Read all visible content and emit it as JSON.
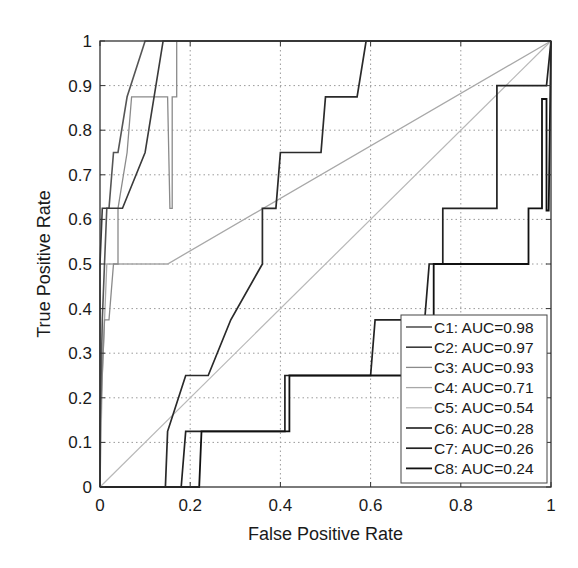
{
  "chart_data": {
    "type": "line",
    "title": "",
    "xlabel": "False Positive Rate",
    "ylabel": "True Positive Rate",
    "xlim": [
      0,
      1
    ],
    "ylim": [
      0,
      1
    ],
    "grid": true,
    "legend_position": "lower right",
    "x_ticks": [
      "0",
      "0.2",
      "0.4",
      "0.6",
      "0.8",
      "1"
    ],
    "y_ticks": [
      "0",
      "0.1",
      "0.2",
      "0.3",
      "0.4",
      "0.5",
      "0.6",
      "0.7",
      "0.8",
      "0.9",
      "1"
    ],
    "series": [
      {
        "name": "C1: AUC=0.98",
        "color": "#555555",
        "width": 1.6,
        "points": [
          [
            0,
            0
          ],
          [
            0,
            0.125
          ],
          [
            0.005,
            0.375
          ],
          [
            0.01,
            0.5
          ],
          [
            0.015,
            0.625
          ],
          [
            0.02,
            0.625
          ],
          [
            0.03,
            0.75
          ],
          [
            0.04,
            0.75
          ],
          [
            0.06,
            0.875
          ],
          [
            0.1,
            1
          ],
          [
            0.15,
            1
          ],
          [
            1,
            1
          ]
        ]
      },
      {
        "name": "C2: AUC=0.97",
        "color": "#3a3a3a",
        "width": 1.6,
        "points": [
          [
            0,
            0
          ],
          [
            0,
            0.5
          ],
          [
            0.005,
            0.625
          ],
          [
            0.05,
            0.625
          ],
          [
            0.1,
            0.75
          ],
          [
            0.14,
            1
          ],
          [
            1,
            1
          ]
        ]
      },
      {
        "name": "C3: AUC=0.93",
        "color": "#8a8a8a",
        "width": 1.3,
        "points": [
          [
            0,
            0
          ],
          [
            0,
            0.125
          ],
          [
            0.01,
            0.375
          ],
          [
            0.02,
            0.375
          ],
          [
            0.03,
            0.5
          ],
          [
            0.04,
            0.5
          ],
          [
            0.04,
            0.625
          ],
          [
            0.06,
            0.75
          ],
          [
            0.07,
            0.875
          ],
          [
            0.15,
            0.875
          ],
          [
            0.155,
            0.625
          ],
          [
            0.16,
            0.625
          ],
          [
            0.16,
            0.875
          ],
          [
            0.17,
            0.875
          ],
          [
            0.17,
            1
          ],
          [
            1,
            1
          ]
        ]
      },
      {
        "name": "C4: AUC=0.71",
        "color": "#a8a8a8",
        "width": 1.3,
        "points": [
          [
            0,
            0
          ],
          [
            0.005,
            0.25
          ],
          [
            0.015,
            0.5
          ],
          [
            0.15,
            0.5
          ],
          [
            1,
            1
          ]
        ]
      },
      {
        "name": "C5: AUC=0.54",
        "color": "#b8b8b8",
        "width": 1.2,
        "points": [
          [
            0,
            0
          ],
          [
            1,
            1
          ]
        ]
      },
      {
        "name": "C6: AUC=0.28",
        "color": "#2a2a2a",
        "width": 1.7,
        "points": [
          [
            0,
            0
          ],
          [
            0.145,
            0
          ],
          [
            0.15,
            0.125
          ],
          [
            0.19,
            0.25
          ],
          [
            0.24,
            0.25
          ],
          [
            0.29,
            0.375
          ],
          [
            0.36,
            0.5
          ],
          [
            0.36,
            0.625
          ],
          [
            0.39,
            0.625
          ],
          [
            0.4,
            0.75
          ],
          [
            0.49,
            0.75
          ],
          [
            0.5,
            0.875
          ],
          [
            0.57,
            0.875
          ],
          [
            0.59,
            1
          ],
          [
            1,
            1
          ]
        ]
      },
      {
        "name": "C7: AUC=0.26",
        "color": "#222222",
        "width": 1.7,
        "points": [
          [
            0,
            0
          ],
          [
            0.18,
            0
          ],
          [
            0.19,
            0.125
          ],
          [
            0.41,
            0.125
          ],
          [
            0.41,
            0.25
          ],
          [
            0.6,
            0.25
          ],
          [
            0.61,
            0.375
          ],
          [
            0.72,
            0.375
          ],
          [
            0.73,
            0.5
          ],
          [
            0.76,
            0.5
          ],
          [
            0.76,
            0.625
          ],
          [
            0.88,
            0.625
          ],
          [
            0.88,
            0.9
          ],
          [
            0.99,
            0.9
          ],
          [
            1,
            1
          ]
        ]
      },
      {
        "name": "C8: AUC=0.24",
        "color": "#111111",
        "width": 1.8,
        "points": [
          [
            0,
            0
          ],
          [
            0.22,
            0
          ],
          [
            0.225,
            0.125
          ],
          [
            0.42,
            0.125
          ],
          [
            0.42,
            0.25
          ],
          [
            0.74,
            0.25
          ],
          [
            0.74,
            0.5
          ],
          [
            0.95,
            0.5
          ],
          [
            0.95,
            0.625
          ],
          [
            0.98,
            0.625
          ],
          [
            0.98,
            0.87
          ],
          [
            0.99,
            0.87
          ],
          [
            0.99,
            0.62
          ],
          [
            0.995,
            0.62
          ],
          [
            1,
            1
          ]
        ]
      }
    ],
    "legend": [
      "C1: AUC=0.98",
      "C2: AUC=0.97",
      "C3: AUC=0.93",
      "C4: AUC=0.71",
      "C5: AUC=0.54",
      "C6: AUC=0.28",
      "C7: AUC=0.26",
      "C8: AUC=0.24"
    ]
  }
}
